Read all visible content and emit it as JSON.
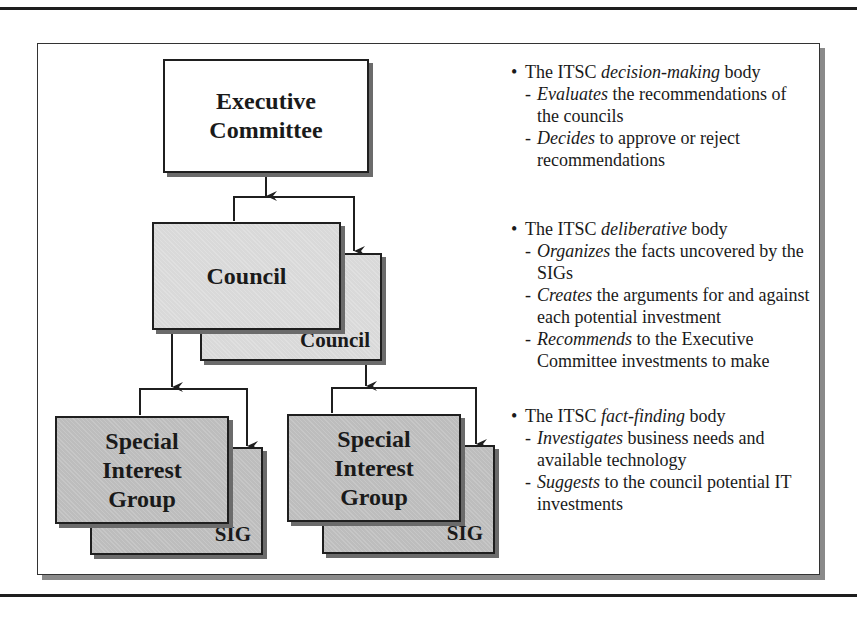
{
  "diagram": {
    "nodes": {
      "executive": {
        "label_line1": "Executive",
        "label_line2": "Committee"
      },
      "council_front": {
        "label": "Council"
      },
      "council_back": {
        "label": "Council"
      },
      "sig1_front": {
        "line1": "Special",
        "line2": "Interest",
        "line3": "Group"
      },
      "sig1_back": {
        "label": "SIG"
      },
      "sig2_front": {
        "line1": "Special",
        "line2": "Interest",
        "line3": "Group"
      },
      "sig2_back": {
        "label": "SIG"
      }
    },
    "colors": {
      "executive_fill": "#ffffff",
      "council_fill": "#d9d9d9",
      "sig_fill": "#bdbdbd",
      "border": "#1f1f1f",
      "shadow": "#6b6b6b"
    }
  },
  "descriptions": [
    {
      "head_prefix": "The ITSC ",
      "head_em": "decision-making",
      "head_suffix": " body",
      "items": [
        {
          "dash": "-",
          "em": "Evaluates",
          "text": " the recommendations of the councils"
        },
        {
          "dash": "-",
          "em": "Decides",
          "text": " to approve or reject recommendations"
        }
      ]
    },
    {
      "head_prefix": "The ITSC ",
      "head_em": "deliberative",
      "head_suffix": " body",
      "items": [
        {
          "dash": "-",
          "em": "Organizes",
          "text": " the facts uncovered by the SIGs"
        },
        {
          "dash": "-",
          "em": "Creates",
          "text": " the arguments for and against each potential investment"
        },
        {
          "dash": "-",
          "em": "Recommends",
          "text": " to the Executive Committee investments to make"
        }
      ]
    },
    {
      "head_prefix": "The ITSC ",
      "head_em": "fact-finding",
      "head_suffix": " body",
      "items": [
        {
          "dash": "-",
          "em": "Investigates",
          "text": " business needs and available technology"
        },
        {
          "dash": "-",
          "em": "Suggests",
          "text": " to the council potential IT investments"
        }
      ]
    }
  ]
}
